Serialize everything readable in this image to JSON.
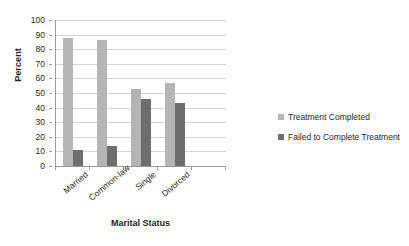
{
  "chart_data": {
    "type": "bar",
    "title": "",
    "subtitle": "",
    "xlabel": "Marital Status",
    "ylabel": "Percent",
    "categories": [
      "Married",
      "Common-law",
      "Single",
      "Divorced"
    ],
    "series": [
      {
        "name": "Treatment Completed",
        "color": "#b5b5b5",
        "values": [
          88,
          86,
          53,
          57
        ]
      },
      {
        "name": "Failed to Complete Treatment",
        "color": "#6e6e6e",
        "values": [
          11,
          14,
          46,
          43
        ]
      }
    ],
    "ylim": [
      0,
      100
    ],
    "ytick_step": 10,
    "ytick_labels": [
      "100",
      "90",
      "80",
      "70",
      "60",
      "50",
      "40",
      "30",
      "20",
      "10",
      "0"
    ],
    "grid": true,
    "grid_axis": "y",
    "legend_position": "right",
    "category_label_rotation": -40,
    "background_color": "#ffffff",
    "axis_color": "#9a9a9a",
    "gridline_color": "#d4d4d4"
  },
  "legend": {
    "items": [
      {
        "label": "Treatment Completed"
      },
      {
        "label": "Failed to Complete Treatment"
      }
    ]
  }
}
